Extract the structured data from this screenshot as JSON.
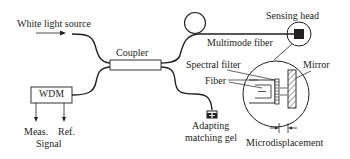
{
  "diagram": {
    "type": "fiber-optic sensor schematic",
    "labels": {
      "source": "White light source",
      "coupler": "Coupler",
      "multimode_fiber": "Multimode fiber",
      "sensing_head": "Sensing head",
      "spectral_filter": "Spectral filter",
      "fiber": "Fiber",
      "mirror": "Mirror",
      "wdm": "WDM",
      "meas": "Meas.",
      "ref": "Ref.",
      "signal": "Signal",
      "gel_line1": "Adapting",
      "gel_line2": "matching gel",
      "microdisplacement": "Microdisplacement"
    },
    "colors": {
      "line": "#231f20",
      "background": "#ffffff"
    }
  }
}
